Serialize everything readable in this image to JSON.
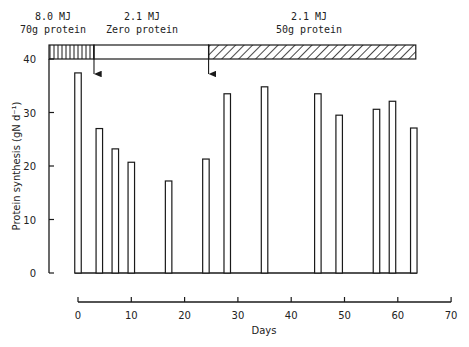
{
  "chart_data": {
    "type": "bar",
    "title": "",
    "xlabel": "Days",
    "ylabel": "Protein synthesis (gN d⁻¹)",
    "xlim": [
      0,
      70
    ],
    "ylim": [
      0,
      40
    ],
    "x_ticks": [
      0,
      10,
      20,
      30,
      40,
      50,
      60,
      70
    ],
    "y_ticks": [
      0,
      10,
      20,
      30,
      40
    ],
    "grid": false,
    "legend": null,
    "x": [
      0,
      4,
      7,
      10,
      17,
      24,
      28,
      35,
      45,
      49,
      56,
      59,
      63
    ],
    "values": [
      37.4,
      27.0,
      23.2,
      20.7,
      17.2,
      21.3,
      33.5,
      34.8,
      33.5,
      29.5,
      30.6,
      32.1,
      27.1
    ],
    "diet_phases": [
      {
        "label_line1": "8.0 MJ",
        "label_line2": "70g protein",
        "start_day": -5.5,
        "end_day": 3,
        "pattern": "vertical-hatch"
      },
      {
        "label_line1": "2.1 MJ",
        "label_line2": "Zero protein",
        "start_day": 3,
        "end_day": 24.5,
        "pattern": "none"
      },
      {
        "label_line1": "2.1 MJ",
        "label_line2": "50g protein",
        "start_day": 24.5,
        "end_day": 63,
        "pattern": "diagonal-hatch"
      }
    ],
    "annotations": [
      {
        "type": "arrow-down",
        "day": 3,
        "meaning": "diet change"
      },
      {
        "type": "arrow-down",
        "day": 24.5,
        "meaning": "diet change"
      }
    ]
  },
  "colors": {
    "ink": "#1a1a1a",
    "background": "#ffffff"
  }
}
